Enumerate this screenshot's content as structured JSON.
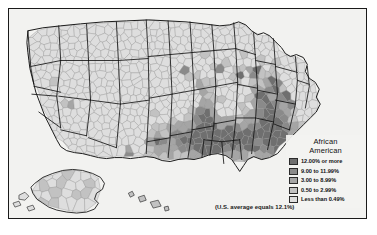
{
  "map": {
    "title": "United States African American population share by county",
    "projection": "Albers conic (contiguous U.S. with Alaska and Hawaii insets)",
    "background_color": "#f2f2f0",
    "border_color": "#1a1a1a",
    "county_outline_color": "#8c8c8c",
    "state_outline_color": "#1a1a1a"
  },
  "legend": {
    "title_line1": "African",
    "title_line2": "American",
    "classes": [
      {
        "label": "12.00% or more",
        "color": "#6f6f6f",
        "min": 12.0,
        "max": null
      },
      {
        "label": "9.00 to 11.99%",
        "color": "#8a8a8a",
        "min": 9.0,
        "max": 11.99
      },
      {
        "label": "3.00 to 8.99%",
        "color": "#a5a5a5",
        "min": 3.0,
        "max": 8.99
      },
      {
        "label": "0.50 to 2.99%",
        "color": "#c2c2c2",
        "min": 0.5,
        "max": 2.99
      },
      {
        "label": "Less than 0.49%",
        "color": "#dedede",
        "min": 0.0,
        "max": 0.49
      }
    ]
  },
  "footnote": {
    "text": "(U.S. average equals 12.1%)"
  },
  "insets": [
    {
      "name": "alaska-inset",
      "label": ""
    },
    {
      "name": "hawaii-inset",
      "label": ""
    }
  ]
}
